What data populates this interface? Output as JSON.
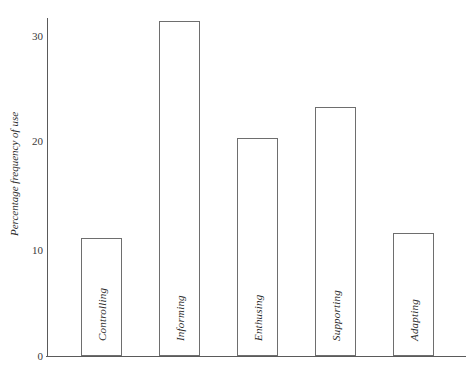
{
  "header": {
    "clipped_text": ""
  },
  "axes": {
    "y_title": "Percentage frequency of use",
    "y_ticks": [
      "0",
      "10",
      "20",
      "30"
    ],
    "x_title": ""
  },
  "chart_data": {
    "type": "bar",
    "title": "",
    "xlabel": "",
    "ylabel": "Percentage frequency of use",
    "categories": [
      "Controlling",
      "Informing",
      "Enthusing",
      "Supporting",
      "Adapting"
    ],
    "values": [
      11.1,
      31.4,
      20.4,
      23.3,
      11.5
    ],
    "ylim": [
      0,
      32
    ],
    "yticks": [
      0,
      10,
      20,
      30
    ],
    "grid": false,
    "legend": false,
    "bar_fill": "#ffffff",
    "bar_stroke": "#6e6e6e",
    "axis_color": "#5a5a5a",
    "background": "#ffffff",
    "labels_inside_bars": true,
    "label_rotation": -90
  }
}
